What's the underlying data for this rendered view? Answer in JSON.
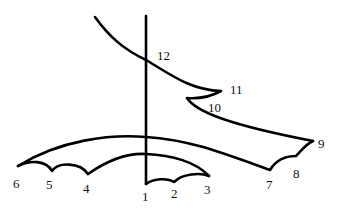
{
  "diagram": {
    "type": "line-drawing",
    "colors": {
      "stroke": "#000000",
      "background": "#ffffff",
      "label": "#111111"
    },
    "labels": [
      {
        "id": "1",
        "text": "1",
        "x": 142,
        "y": 201
      },
      {
        "id": "2",
        "text": "2",
        "x": 171,
        "y": 198
      },
      {
        "id": "3",
        "text": "3",
        "x": 204,
        "y": 194
      },
      {
        "id": "4",
        "text": "4",
        "x": 83,
        "y": 193
      },
      {
        "id": "5",
        "text": "5",
        "x": 46,
        "y": 189
      },
      {
        "id": "6",
        "text": "6",
        "x": 13,
        "y": 188
      },
      {
        "id": "7",
        "text": "7",
        "x": 266,
        "y": 189
      },
      {
        "id": "8",
        "text": "8",
        "x": 293,
        "y": 178
      },
      {
        "id": "9",
        "text": "9",
        "x": 318,
        "y": 148
      },
      {
        "id": "10",
        "text": "10",
        "x": 208,
        "y": 112
      },
      {
        "id": "11",
        "text": "11",
        "x": 230,
        "y": 94
      },
      {
        "id": "12",
        "text": "12",
        "x": 157,
        "y": 60
      }
    ]
  }
}
